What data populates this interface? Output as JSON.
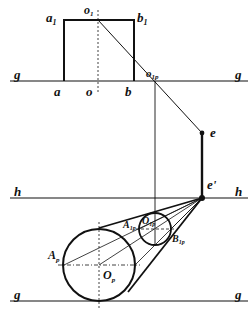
{
  "diagram": {
    "type": "perspective-construction",
    "colors": {
      "stroke": "#111111",
      "background": "#ffffff"
    },
    "lines": {
      "g_top": {
        "label_left": "g",
        "label_right": "g",
        "y": 81
      },
      "h": {
        "label_left": "h",
        "label_right": "h",
        "y": 198
      },
      "g_bottom": {
        "label_left": "g",
        "label_right": "g",
        "y": 301
      }
    },
    "rectangle": {
      "corners": {
        "a1": "a",
        "b1": "b"
      },
      "labels": {
        "a1_main": "a",
        "a1_sub": "1",
        "b1_main": "b",
        "b1_sub": "1",
        "o1_main": "o",
        "o1_sub": "1",
        "a": "a",
        "o": "o",
        "b": "b"
      }
    },
    "points": {
      "o1p_main": "o",
      "o1p_sub": "1p",
      "e": "e",
      "e_prime": "e'"
    },
    "circles": {
      "large": {
        "center_main": "O",
        "center_sub": "p",
        "left_main": "A",
        "left_sub": "p"
      },
      "small": {
        "center_main": "O",
        "center_sub": "1p",
        "left_main": "A",
        "left_sub": "1p",
        "right_main": "B",
        "right_sub": "1p"
      }
    }
  }
}
